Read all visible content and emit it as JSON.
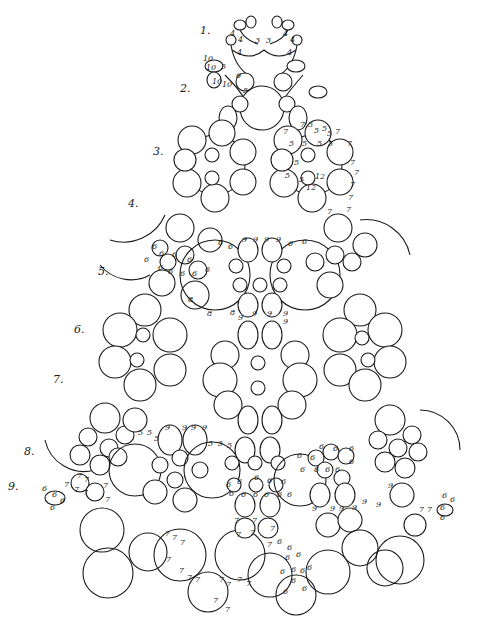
{
  "diagram": {
    "type": "tatting-pattern",
    "background": "#ffffff",
    "ink": "#1a1a1a",
    "round_labels": [
      {
        "label": "1.",
        "x": 200,
        "y": 34
      },
      {
        "label": "2.",
        "x": 180,
        "y": 92
      },
      {
        "label": "3.",
        "x": 153,
        "y": 155
      },
      {
        "label": "4.",
        "x": 128,
        "y": 207
      },
      {
        "label": "5.",
        "x": 98,
        "y": 275
      },
      {
        "label": "6.",
        "x": 74,
        "y": 333
      },
      {
        "label": "7.",
        "x": 53,
        "y": 383
      },
      {
        "label": "8.",
        "x": 24,
        "y": 455
      },
      {
        "label": "9.",
        "x": 8,
        "y": 490
      }
    ],
    "stitch_counts": [
      {
        "t": "4",
        "x": 230,
        "y": 36
      },
      {
        "t": "4",
        "x": 238,
        "y": 42
      },
      {
        "t": "3",
        "x": 255,
        "y": 43
      },
      {
        "t": "3",
        "x": 266,
        "y": 43
      },
      {
        "t": "4",
        "x": 283,
        "y": 36
      },
      {
        "t": "4",
        "x": 290,
        "y": 42
      },
      {
        "t": "4",
        "x": 237,
        "y": 55
      },
      {
        "t": "4",
        "x": 287,
        "y": 55
      },
      {
        "t": "10",
        "x": 203,
        "y": 61
      },
      {
        "t": "10",
        "x": 206,
        "y": 70
      },
      {
        "t": "5",
        "x": 221,
        "y": 69
      },
      {
        "t": "10",
        "x": 212,
        "y": 84
      },
      {
        "t": "10",
        "x": 222,
        "y": 87
      },
      {
        "t": "6",
        "x": 236,
        "y": 78
      },
      {
        "t": "5",
        "x": 243,
        "y": 93
      },
      {
        "t": "7",
        "x": 300,
        "y": 127
      },
      {
        "t": "5",
        "x": 308,
        "y": 127
      },
      {
        "t": "5",
        "x": 314,
        "y": 133
      },
      {
        "t": "5",
        "x": 322,
        "y": 131
      },
      {
        "t": "5",
        "x": 327,
        "y": 136
      },
      {
        "t": "7",
        "x": 335,
        "y": 134
      },
      {
        "t": "7",
        "x": 283,
        "y": 134
      },
      {
        "t": "5",
        "x": 289,
        "y": 146
      },
      {
        "t": "5",
        "x": 302,
        "y": 146
      },
      {
        "t": "5",
        "x": 317,
        "y": 146
      },
      {
        "t": "5",
        "x": 328,
        "y": 146
      },
      {
        "t": "7",
        "x": 347,
        "y": 146
      },
      {
        "t": "5",
        "x": 294,
        "y": 165
      },
      {
        "t": "5",
        "x": 285,
        "y": 178
      },
      {
        "t": "5",
        "x": 299,
        "y": 182
      },
      {
        "t": "12",
        "x": 315,
        "y": 179
      },
      {
        "t": "12",
        "x": 306,
        "y": 190
      },
      {
        "t": "7",
        "x": 350,
        "y": 165
      },
      {
        "t": "7",
        "x": 354,
        "y": 175
      },
      {
        "t": "7",
        "x": 350,
        "y": 187
      },
      {
        "t": "7",
        "x": 348,
        "y": 200
      },
      {
        "t": "7",
        "x": 327,
        "y": 214
      },
      {
        "t": "7",
        "x": 346,
        "y": 212
      },
      {
        "t": "6",
        "x": 218,
        "y": 245
      },
      {
        "t": "6",
        "x": 228,
        "y": 249
      },
      {
        "t": "9",
        "x": 242,
        "y": 242
      },
      {
        "t": "9",
        "x": 253,
        "y": 242
      },
      {
        "t": "9",
        "x": 264,
        "y": 242
      },
      {
        "t": "9",
        "x": 276,
        "y": 242
      },
      {
        "t": "6",
        "x": 288,
        "y": 246
      },
      {
        "t": "6",
        "x": 302,
        "y": 244
      },
      {
        "t": "6",
        "x": 152,
        "y": 249
      },
      {
        "t": "6",
        "x": 159,
        "y": 256
      },
      {
        "t": "6",
        "x": 144,
        "y": 262
      },
      {
        "t": "6",
        "x": 172,
        "y": 257
      },
      {
        "t": "6",
        "x": 187,
        "y": 262
      },
      {
        "t": "6",
        "x": 158,
        "y": 270
      },
      {
        "t": "6",
        "x": 168,
        "y": 274
      },
      {
        "t": "6",
        "x": 180,
        "y": 276
      },
      {
        "t": "6",
        "x": 192,
        "y": 276
      },
      {
        "t": "6",
        "x": 205,
        "y": 272
      },
      {
        "t": "8",
        "x": 188,
        "y": 302
      },
      {
        "t": "8",
        "x": 207,
        "y": 316
      },
      {
        "t": "8",
        "x": 230,
        "y": 315
      },
      {
        "t": "9",
        "x": 238,
        "y": 320
      },
      {
        "t": "9",
        "x": 252,
        "y": 316
      },
      {
        "t": "9",
        "x": 267,
        "y": 316
      },
      {
        "t": "9",
        "x": 283,
        "y": 316
      },
      {
        "t": "9",
        "x": 283,
        "y": 324
      },
      {
        "t": "5",
        "x": 138,
        "y": 435
      },
      {
        "t": "5",
        "x": 147,
        "y": 435
      },
      {
        "t": "5",
        "x": 154,
        "y": 441
      },
      {
        "t": "9",
        "x": 165,
        "y": 430
      },
      {
        "t": "9",
        "x": 182,
        "y": 430
      },
      {
        "t": "9",
        "x": 191,
        "y": 430
      },
      {
        "t": "9",
        "x": 202,
        "y": 430
      },
      {
        "t": "5",
        "x": 208,
        "y": 446
      },
      {
        "t": "5",
        "x": 218,
        "y": 446
      },
      {
        "t": "5",
        "x": 227,
        "y": 448
      },
      {
        "t": "6",
        "x": 226,
        "y": 487
      },
      {
        "t": "6",
        "x": 237,
        "y": 484
      },
      {
        "t": "6",
        "x": 254,
        "y": 480
      },
      {
        "t": "6",
        "x": 267,
        "y": 483
      },
      {
        "t": "6",
        "x": 281,
        "y": 484
      },
      {
        "t": "6",
        "x": 229,
        "y": 496
      },
      {
        "t": "6",
        "x": 241,
        "y": 497
      },
      {
        "t": "6",
        "x": 253,
        "y": 497
      },
      {
        "t": "6",
        "x": 264,
        "y": 497
      },
      {
        "t": "6",
        "x": 277,
        "y": 497
      },
      {
        "t": "6",
        "x": 287,
        "y": 497
      },
      {
        "t": "6",
        "x": 297,
        "y": 458
      },
      {
        "t": "6",
        "x": 310,
        "y": 460
      },
      {
        "t": "6",
        "x": 319,
        "y": 449
      },
      {
        "t": "6",
        "x": 333,
        "y": 451
      },
      {
        "t": "6",
        "x": 349,
        "y": 451
      },
      {
        "t": "6",
        "x": 300,
        "y": 472
      },
      {
        "t": "6",
        "x": 314,
        "y": 472
      },
      {
        "t": "6",
        "x": 325,
        "y": 472
      },
      {
        "t": "6",
        "x": 335,
        "y": 472
      },
      {
        "t": "6",
        "x": 349,
        "y": 464
      },
      {
        "t": "9",
        "x": 312,
        "y": 511
      },
      {
        "t": "9",
        "x": 330,
        "y": 511
      },
      {
        "t": "9",
        "x": 339,
        "y": 511
      },
      {
        "t": "9",
        "x": 352,
        "y": 510
      },
      {
        "t": "9",
        "x": 362,
        "y": 504
      },
      {
        "t": "9",
        "x": 376,
        "y": 507
      },
      {
        "t": "9",
        "x": 388,
        "y": 488
      },
      {
        "t": "7",
        "x": 234,
        "y": 523
      },
      {
        "t": "7",
        "x": 252,
        "y": 523
      },
      {
        "t": "7",
        "x": 270,
        "y": 531
      },
      {
        "t": "7",
        "x": 250,
        "y": 535
      },
      {
        "t": "7",
        "x": 236,
        "y": 537
      },
      {
        "t": "7",
        "x": 267,
        "y": 547
      },
      {
        "t": "7",
        "x": 165,
        "y": 536
      },
      {
        "t": "7",
        "x": 172,
        "y": 540
      },
      {
        "t": "7",
        "x": 180,
        "y": 545
      },
      {
        "t": "7",
        "x": 166,
        "y": 562
      },
      {
        "t": "7",
        "x": 179,
        "y": 573
      },
      {
        "t": "7",
        "x": 187,
        "y": 580
      },
      {
        "t": "7",
        "x": 195,
        "y": 582
      },
      {
        "t": "7",
        "x": 219,
        "y": 582
      },
      {
        "t": "7",
        "x": 226,
        "y": 587
      },
      {
        "t": "7",
        "x": 237,
        "y": 582
      },
      {
        "t": "7",
        "x": 213,
        "y": 603
      },
      {
        "t": "7",
        "x": 225,
        "y": 612
      },
      {
        "t": "7",
        "x": 246,
        "y": 586
      },
      {
        "t": "6",
        "x": 277,
        "y": 544
      },
      {
        "t": "6",
        "x": 287,
        "y": 550
      },
      {
        "t": "6",
        "x": 285,
        "y": 560
      },
      {
        "t": "6",
        "x": 296,
        "y": 557
      },
      {
        "t": "6",
        "x": 280,
        "y": 574
      },
      {
        "t": "6",
        "x": 291,
        "y": 572
      },
      {
        "t": "6",
        "x": 300,
        "y": 573
      },
      {
        "t": "6",
        "x": 307,
        "y": 570
      },
      {
        "t": "6",
        "x": 291,
        "y": 583
      },
      {
        "t": "6",
        "x": 302,
        "y": 591
      },
      {
        "t": "6",
        "x": 283,
        "y": 594
      },
      {
        "t": "7",
        "x": 77,
        "y": 478
      },
      {
        "t": "7",
        "x": 84,
        "y": 482
      },
      {
        "t": "7",
        "x": 64,
        "y": 487
      },
      {
        "t": "7",
        "x": 74,
        "y": 492
      },
      {
        "t": "7",
        "x": 83,
        "y": 495
      },
      {
        "t": "7",
        "x": 103,
        "y": 488
      },
      {
        "t": "7",
        "x": 105,
        "y": 502
      },
      {
        "t": "6",
        "x": 42,
        "y": 491
      },
      {
        "t": "6",
        "x": 52,
        "y": 497
      },
      {
        "t": "6",
        "x": 60,
        "y": 503
      },
      {
        "t": "6",
        "x": 50,
        "y": 510
      },
      {
        "t": "7",
        "x": 419,
        "y": 512
      },
      {
        "t": "7",
        "x": 427,
        "y": 512
      },
      {
        "t": "6",
        "x": 442,
        "y": 498
      },
      {
        "t": "6",
        "x": 450,
        "y": 502
      },
      {
        "t": "6",
        "x": 440,
        "y": 510
      },
      {
        "t": "6",
        "x": 440,
        "y": 520
      }
    ]
  }
}
